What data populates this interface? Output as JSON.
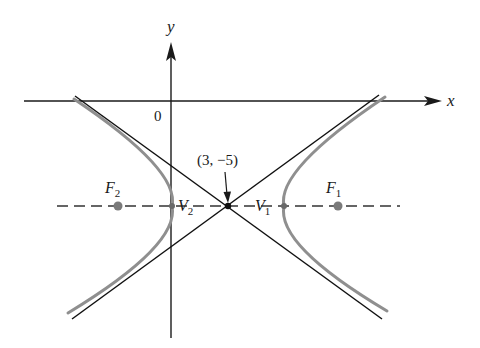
{
  "diagram": {
    "type": "hyperbola",
    "axes": {
      "x_label": "x",
      "y_label": "y",
      "origin_label": "0"
    },
    "center": {
      "label": "(3, −5)",
      "coords": [
        3,
        -5
      ]
    },
    "points": [
      {
        "name": "F2",
        "letter": "F",
        "sub": "2",
        "role": "focus"
      },
      {
        "name": "V2",
        "letter": "V",
        "sub": "2",
        "role": "vertex"
      },
      {
        "name": "V1",
        "letter": "V",
        "sub": "1",
        "role": "vertex"
      },
      {
        "name": "F1",
        "letter": "F",
        "sub": "1",
        "role": "focus"
      }
    ],
    "elements": {
      "asymptotes": 2,
      "transverse_axis": "dashed horizontal line through center",
      "branches": 2
    },
    "colors": {
      "axes": "#1a1a1a",
      "asymptotes": "#111111",
      "curve": "#8f8f8f",
      "points": "#7a7a7a",
      "dashed": "#333333"
    }
  }
}
